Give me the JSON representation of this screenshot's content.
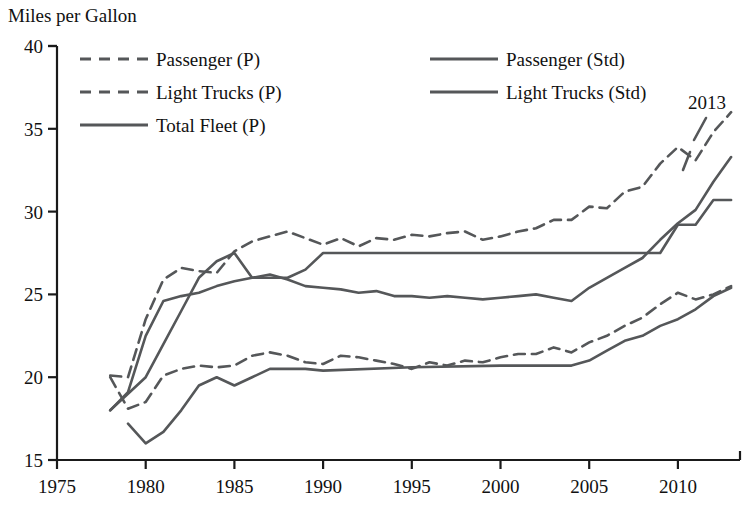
{
  "chart_data": {
    "type": "line",
    "title": "",
    "ylabel": "Miles per Gallon",
    "xlabel": "",
    "xlim": [
      1975,
      2013.5
    ],
    "ylim": [
      15,
      40
    ],
    "yticks": [
      15,
      20,
      25,
      30,
      35,
      40
    ],
    "xticks": [
      1975,
      1980,
      1985,
      1990,
      1995,
      2000,
      2005,
      2010
    ],
    "grid": false,
    "legend_position": "top-inside",
    "annotations": [
      {
        "text": "2013",
        "x": 2012.2,
        "y": 37.6
      }
    ],
    "series": [
      {
        "name": "Passenger (P)",
        "style": "dashed",
        "x": [
          1978,
          1979,
          1980,
          1981,
          1982,
          1983,
          1984,
          1985,
          1986,
          1987,
          1988,
          1989,
          1990,
          1991,
          1992,
          1993,
          1994,
          1995,
          1996,
          1997,
          1998,
          1999,
          2000,
          2001,
          2002,
          2003,
          2004,
          2005,
          2006,
          2007,
          2008,
          2009,
          2010,
          2011,
          2012,
          2013
        ],
        "values": [
          20.1,
          20.0,
          23.5,
          25.9,
          26.6,
          26.4,
          26.3,
          27.6,
          28.2,
          28.5,
          28.8,
          28.4,
          28.0,
          28.4,
          27.9,
          28.4,
          28.3,
          28.6,
          28.5,
          28.7,
          28.8,
          28.3,
          28.5,
          28.8,
          29.0,
          29.5,
          29.5,
          30.3,
          30.2,
          31.2,
          31.5,
          32.9,
          33.9,
          33.1,
          34.8,
          36.0
        ]
      },
      {
        "name": "Light Trucks (P)",
        "style": "dashed",
        "x": [
          1978,
          1979,
          1980,
          1981,
          1982,
          1983,
          1984,
          1985,
          1986,
          1987,
          1988,
          1989,
          1990,
          1991,
          1992,
          1993,
          1994,
          1995,
          1996,
          1997,
          1998,
          1999,
          2000,
          2001,
          2002,
          2003,
          2004,
          2005,
          2006,
          2007,
          2008,
          2009,
          2010,
          2011,
          2012,
          2013
        ],
        "values": [
          20.0,
          18.1,
          18.5,
          20.1,
          20.5,
          20.7,
          20.6,
          20.7,
          21.3,
          21.5,
          21.3,
          20.9,
          20.8,
          21.3,
          21.2,
          21.0,
          20.8,
          20.5,
          20.9,
          20.7,
          21.0,
          20.9,
          21.2,
          21.4,
          21.4,
          21.8,
          21.5,
          22.1,
          22.5,
          23.1,
          23.6,
          24.4,
          25.1,
          24.7,
          25.0,
          25.5
        ]
      },
      {
        "name": "Total Fleet (P)",
        "style": "solid",
        "x": [
          1978,
          1979,
          1980,
          1981,
          1982,
          1983,
          1984,
          1985,
          1986,
          1987,
          1988,
          1989,
          1990,
          1991,
          1992,
          1993,
          1994,
          1995,
          1996,
          1997,
          1998,
          1999,
          2000,
          2001,
          2002,
          2003,
          2004,
          2005,
          2006,
          2007,
          2008,
          2009,
          2010,
          2011,
          2012,
          2013
        ],
        "values": [
          18.0,
          19.1,
          22.5,
          24.6,
          24.9,
          25.1,
          25.5,
          25.8,
          26.0,
          26.2,
          25.9,
          25.5,
          25.4,
          25.3,
          25.1,
          25.2,
          24.9,
          24.9,
          24.8,
          24.9,
          24.8,
          24.7,
          24.8,
          24.9,
          25.0,
          24.8,
          24.6,
          25.4,
          26.0,
          26.6,
          27.2,
          28.3,
          29.3,
          30.1,
          31.8,
          33.3
        ]
      },
      {
        "name": "Passenger (Std)",
        "style": "solid",
        "x": [
          1978,
          1979,
          1980,
          1981,
          1982,
          1983,
          1984,
          1985,
          1986,
          1987,
          1988,
          1989,
          1990,
          1995,
          2000,
          2005,
          2008,
          2009,
          2010,
          2011,
          2012,
          2013
        ],
        "values": [
          18.0,
          19.0,
          20.0,
          22.0,
          24.0,
          26.0,
          27.0,
          27.5,
          26.0,
          26.0,
          26.0,
          26.5,
          27.5,
          27.5,
          27.5,
          27.5,
          27.5,
          27.5,
          29.2,
          29.2,
          30.7,
          30.7
        ]
      },
      {
        "name": "Light Trucks (Std)",
        "style": "solid",
        "x": [
          1979,
          1980,
          1981,
          1982,
          1983,
          1984,
          1985,
          1986,
          1987,
          1988,
          1989,
          1990,
          1995,
          2000,
          2004,
          2005,
          2006,
          2007,
          2008,
          2009,
          2010,
          2011,
          2012,
          2013
        ],
        "values": [
          17.2,
          16.0,
          16.7,
          18.0,
          19.5,
          20.0,
          19.5,
          20.0,
          20.5,
          20.5,
          20.5,
          20.4,
          20.6,
          20.7,
          20.7,
          21.0,
          21.6,
          22.2,
          22.5,
          23.1,
          23.5,
          24.1,
          24.9,
          25.4
        ]
      }
    ]
  },
  "axis": {
    "y_title": "Miles per Gallon",
    "y_ticks": [
      "40",
      "35",
      "30",
      "25",
      "20",
      "15"
    ],
    "x_ticks": [
      "1975",
      "1980",
      "1985",
      "1990",
      "1995",
      "2000",
      "2005",
      "2010"
    ]
  },
  "legend": {
    "column_left": [
      {
        "label": "Passenger (P)",
        "style": "dashed"
      },
      {
        "label": "Light Trucks (P)",
        "style": "dashed"
      },
      {
        "label": "Total Fleet (P)",
        "style": "solid"
      }
    ],
    "column_right": [
      {
        "label": "Passenger (Std)",
        "style": "solid"
      },
      {
        "label": "Light Trucks (Std)",
        "style": "solid"
      }
    ]
  },
  "annotation": {
    "end_year": "2013"
  },
  "colors": {
    "line": "#555759",
    "axis": "#1a1a1a",
    "text": "#111111",
    "background": "#ffffff"
  }
}
